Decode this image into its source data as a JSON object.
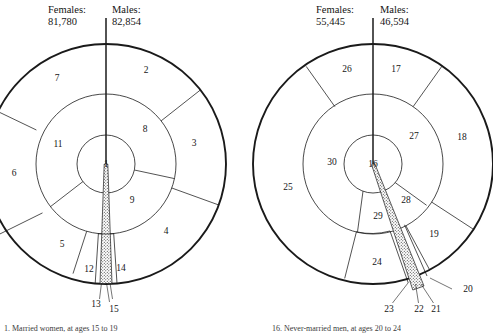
{
  "page": {
    "width": 493,
    "height": 329,
    "background": "#ffffff",
    "ink": "#1a1a1a"
  },
  "diagrams": [
    {
      "id": "left-diagram",
      "name": "left-circular-diagram",
      "header": {
        "females_label": "Females:",
        "females_value": "81,780",
        "males_label": "Males:",
        "males_value": "82,854"
      },
      "center": {
        "x": 106,
        "y": 164
      },
      "radii": {
        "inner": 29,
        "middle": 70,
        "outer": 120
      },
      "segments": [
        {
          "n": "1",
          "ring": "inner",
          "x": 106,
          "y": 167
        },
        {
          "n": "2",
          "ring": "outer",
          "x": 146,
          "y": 73
        },
        {
          "n": "3",
          "ring": "outer",
          "x": 194,
          "y": 146
        },
        {
          "n": "4",
          "ring": "outer",
          "x": 166,
          "y": 234
        },
        {
          "n": "5",
          "ring": "outer",
          "x": 62,
          "y": 247
        },
        {
          "n": "6",
          "ring": "outer",
          "x": 14,
          "y": 176
        },
        {
          "n": "7",
          "ring": "outer",
          "x": 57,
          "y": 81
        },
        {
          "n": "8",
          "ring": "middle",
          "x": 145,
          "y": 132
        },
        {
          "n": "9",
          "ring": "middle",
          "x": 132,
          "y": 203
        },
        {
          "n": "11",
          "ring": "middle",
          "x": 58,
          "y": 147
        },
        {
          "n": "12",
          "ring": "wedge",
          "x": 89,
          "y": 271
        },
        {
          "n": "14",
          "ring": "wedge",
          "x": 119,
          "y": 270
        }
      ],
      "leader_labels": [
        {
          "n": "13",
          "x": 96,
          "y": 303
        },
        {
          "n": "15",
          "x": 113,
          "y": 307
        }
      ]
    },
    {
      "id": "right-diagram",
      "name": "right-circular-diagram",
      "header": {
        "females_label": "Females:",
        "females_value": "55,445",
        "males_label": "Males:",
        "males_value": "46,594"
      },
      "center": {
        "x": 373,
        "y": 164
      },
      "radii": {
        "inner": 29,
        "middle": 70,
        "outer": 120
      },
      "segments": [
        {
          "n": "16",
          "ring": "inner",
          "x": 373,
          "y": 164
        },
        {
          "n": "17",
          "ring": "outer",
          "x": 396,
          "y": 70
        },
        {
          "n": "18",
          "ring": "outer",
          "x": 462,
          "y": 136
        },
        {
          "n": "19",
          "ring": "outer",
          "x": 432,
          "y": 235
        },
        {
          "n": "20",
          "ring": "outer",
          "x": 467,
          "y": 287
        },
        {
          "n": "24",
          "ring": "outer",
          "x": 376,
          "y": 263
        },
        {
          "n": "25",
          "ring": "outer",
          "x": 287,
          "y": 186
        },
        {
          "n": "26",
          "ring": "outer",
          "x": 346,
          "y": 70
        },
        {
          "n": "27",
          "ring": "middle",
          "x": 413,
          "y": 135
        },
        {
          "n": "28",
          "ring": "middle",
          "x": 405,
          "y": 200
        },
        {
          "n": "29",
          "ring": "middle",
          "x": 377,
          "y": 215
        },
        {
          "n": "30",
          "ring": "middle",
          "x": 331,
          "y": 161
        }
      ],
      "leader_labels": [
        {
          "n": "23",
          "x": 389,
          "y": 311
        },
        {
          "n": "22",
          "x": 418,
          "y": 311
        },
        {
          "n": "21",
          "x": 435,
          "y": 311
        }
      ]
    }
  ],
  "footnotes": {
    "left": "1. Married women, at ages 15 to 19",
    "right": "16. Never-married men, at ages 20 to 24"
  }
}
